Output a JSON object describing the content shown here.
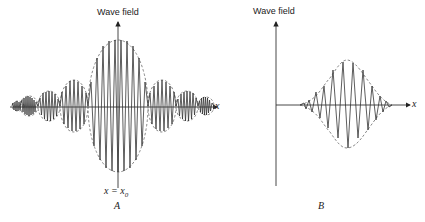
{
  "figure": {
    "panels": [
      {
        "id": "A",
        "panel_label": "A",
        "y_axis_label": "Wave field",
        "x_axis_label": "x",
        "center_marker": "x = x",
        "center_marker_sub": "0",
        "description": "Wave packet with central lobe at x = x0 and decaying symmetric side lobes (dashed envelopes)"
      },
      {
        "id": "B",
        "panel_label": "B",
        "y_axis_label": "Wave field",
        "x_axis_label": "x",
        "description": "Single Gaussian wave packet with dashed envelope"
      }
    ],
    "colors": {
      "line": "#333333",
      "envelope": "#555555",
      "background": "#ffffff"
    }
  }
}
